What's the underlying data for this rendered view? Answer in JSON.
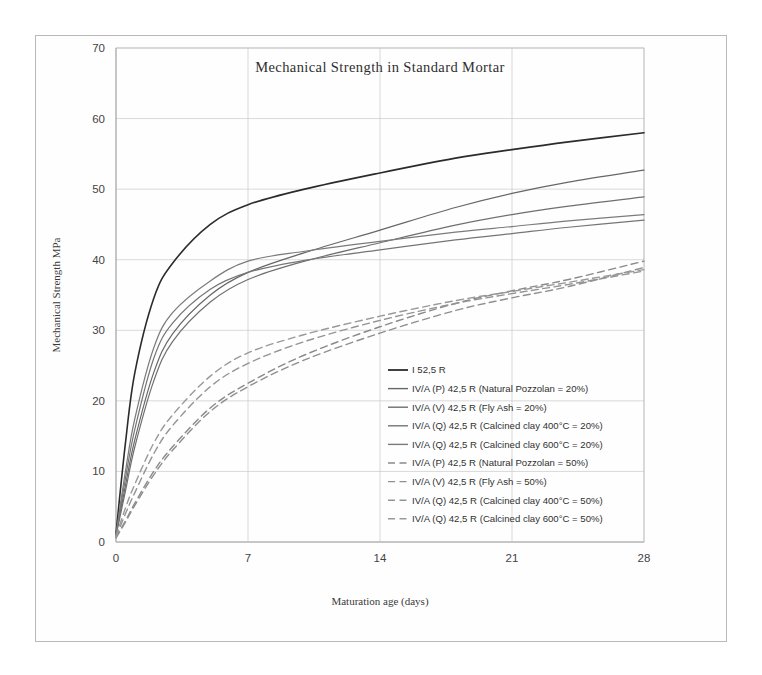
{
  "chart_data": {
    "type": "line",
    "title": "Mechanical  Strength  in  Standard  Mortar",
    "xlabel": "Maturation age (days)",
    "ylabel": "Mechanical Strength MPa",
    "xlim": [
      0,
      28
    ],
    "ylim": [
      0,
      70
    ],
    "xticks": [
      "0",
      "7",
      "14",
      "21",
      "28"
    ],
    "xtick_values": [
      0,
      7,
      14,
      21,
      28
    ],
    "yticks": [
      "0",
      "10",
      "20",
      "30",
      "40",
      "50",
      "60",
      "70"
    ],
    "ytick_values": [
      0,
      10,
      20,
      30,
      40,
      50,
      60,
      70
    ],
    "grid": true,
    "legend_position": "inside-lower-right",
    "x": [
      0,
      0.5,
      1,
      2,
      3,
      5,
      7,
      10,
      14,
      18,
      21,
      24,
      28
    ],
    "series": [
      {
        "name": "I 52,5 R",
        "style": "solid",
        "color": "#2b2b2b",
        "width": 1.6,
        "values": [
          1.2,
          14.0,
          24.0,
          34.5,
          39.5,
          45.0,
          47.8,
          50.0,
          52.3,
          54.4,
          55.6,
          56.7,
          58.0
        ]
      },
      {
        "name": "IV/A (P) 42,5 R  (Natural Pozzolan = 20%)",
        "style": "solid",
        "color": "#676767",
        "width": 1.2,
        "values": [
          1.0,
          8.0,
          14.5,
          24.0,
          29.5,
          35.0,
          38.2,
          41.0,
          44.2,
          47.4,
          49.4,
          51.0,
          52.7
        ]
      },
      {
        "name": "IV/A (V) 42,5 R  (Fly Ash = 20%)",
        "style": "solid",
        "color": "#6f6f6f",
        "width": 1.2,
        "values": [
          0.9,
          7.2,
          13.5,
          22.8,
          28.4,
          34.0,
          37.2,
          39.8,
          42.4,
          44.9,
          46.4,
          47.6,
          48.9
        ]
      },
      {
        "name": "IV/A (Q) 42,5 R  (Calcined clay 400°C = 20%)",
        "style": "solid",
        "color": "#757575",
        "width": 1.2,
        "values": [
          1.0,
          9.0,
          16.0,
          26.0,
          31.0,
          35.8,
          38.2,
          39.9,
          41.4,
          42.8,
          43.7,
          44.6,
          45.6
        ]
      },
      {
        "name": "IV/A (Q) 42,5 R  (Calcined clay 600°C = 20%)",
        "style": "solid",
        "color": "#7b7b7b",
        "width": 1.2,
        "values": [
          1.1,
          10.0,
          17.5,
          27.5,
          32.5,
          37.0,
          39.8,
          41.2,
          42.6,
          43.9,
          44.7,
          45.5,
          46.4
        ]
      },
      {
        "name": "IV/A (P) 42,5 R  (Natural Pozzolan = 50%)",
        "style": "dashed",
        "color": "#8a8a8a",
        "width": 1.4,
        "values": [
          0.6,
          3.0,
          5.5,
          10.0,
          13.5,
          19.0,
          22.5,
          26.5,
          30.5,
          33.8,
          35.6,
          37.2,
          39.8
        ]
      },
      {
        "name": "IV/A (V) 42,5 R  (Fly Ash = 50%)",
        "style": "dashed",
        "color": "#8f8f8f",
        "width": 1.4,
        "values": [
          0.6,
          2.8,
          5.2,
          9.5,
          13.0,
          18.5,
          22.0,
          25.8,
          29.6,
          32.8,
          34.6,
          36.2,
          38.9
        ]
      },
      {
        "name": "IV/A (Q) 42,5 R  (Calcined clay 400°C = 50%)",
        "style": "dashed",
        "color": "#949494",
        "width": 1.4,
        "values": [
          0.7,
          4.0,
          7.0,
          12.5,
          16.5,
          22.0,
          25.3,
          28.4,
          31.4,
          33.8,
          35.2,
          36.5,
          38.4
        ]
      },
      {
        "name": "IV/A (Q) 42,5 R  (Calcined clay 600°C = 50%)",
        "style": "dashed",
        "color": "#999999",
        "width": 1.4,
        "values": [
          0.8,
          4.8,
          8.2,
          14.0,
          18.0,
          23.5,
          26.8,
          29.4,
          32.0,
          34.2,
          35.5,
          36.8,
          38.6
        ]
      }
    ]
  }
}
